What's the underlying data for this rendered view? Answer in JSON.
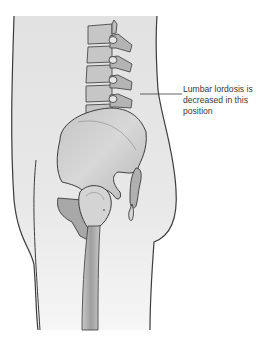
{
  "figure": {
    "annotation": {
      "lines": [
        "Lumbar lordosis is",
        "decreased in this",
        "position"
      ],
      "full_text": "Lumbar lordosis is decreased in this position"
    },
    "structures": [
      "body-outline",
      "lumbar-vertebrae",
      "pelvis",
      "sacrum-coccyx",
      "femoral-head",
      "femur-shaft"
    ],
    "colors": {
      "body_fill": "#e4e4e4",
      "bone_fill": "#b9b9b9",
      "bone_light": "#d6d6d6",
      "outline": "#3c3c3c",
      "text": "#3a3a3a"
    }
  }
}
